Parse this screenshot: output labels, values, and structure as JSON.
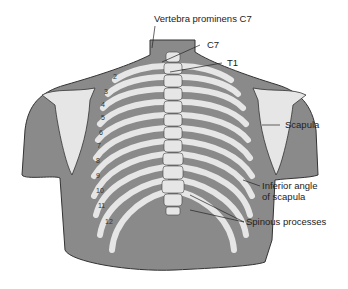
{
  "diagram": {
    "labels": {
      "vertebra_prominens": "Vertebra prominens C7",
      "c7": "C7",
      "t1": "T1",
      "scapula": "Scapula",
      "inferior_angle_line1": "Inferior angle",
      "inferior_angle_line2": "of scapula",
      "spinous_processes": "Spinous processes"
    },
    "rib_numbers": [
      "2",
      "3",
      "4",
      "5",
      "6",
      "7",
      "8",
      "9",
      "10",
      "11",
      "12"
    ],
    "colors": {
      "skin": "#8a8a8a",
      "bone": "#e6e6e6",
      "outline": "#333333",
      "background": "#ffffff"
    }
  }
}
